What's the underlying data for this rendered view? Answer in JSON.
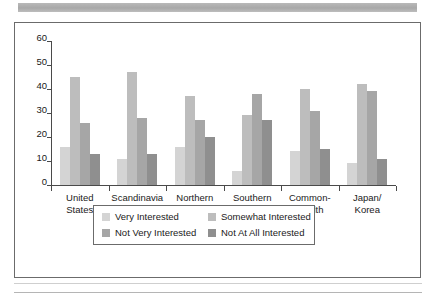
{
  "chart_data": {
    "type": "bar",
    "title": "",
    "subtitle": "",
    "xlabel": "",
    "ylabel": "",
    "ylim": [
      0,
      60
    ],
    "yticks": [
      0,
      10,
      20,
      30,
      40,
      50,
      60
    ],
    "ytick_labels": [
      "0",
      "10",
      "20",
      "30",
      "40",
      "50",
      "60"
    ],
    "grid": false,
    "legend_position": "bottom",
    "categories": [
      "United\nStates",
      "Scandinavia",
      "Northern\nEurope",
      "Southern\nEurope",
      "Common-\nwealth",
      "Japan/\nKorea"
    ],
    "series": [
      {
        "name": "Very Interested",
        "color": "#d4d4d4",
        "values": [
          16,
          11,
          16,
          6,
          14,
          9
        ]
      },
      {
        "name": "Somewhat Interested",
        "color": "#bdbdbd",
        "values": [
          45,
          47,
          37,
          29,
          40,
          42
        ]
      },
      {
        "name": "Not Very Interested",
        "color": "#a6a6a6",
        "values": [
          26,
          28,
          27,
          38,
          31,
          39
        ]
      },
      {
        "name": "Not At All Interested",
        "color": "#8f8f8f",
        "values": [
          13,
          13,
          20,
          27,
          15,
          11
        ]
      }
    ]
  },
  "legend": {
    "entries": [
      "Very Interested",
      "Somewhat Interested",
      "Not Very Interested",
      "Not At All Interested"
    ]
  },
  "decor": {
    "banner_color": "#b0b0b0",
    "frame_color": "#6b6b6b",
    "axis_color": "#4a4a4a",
    "text_color": "#1a1a1a"
  }
}
